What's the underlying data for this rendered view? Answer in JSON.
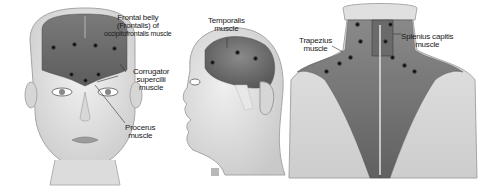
{
  "figure": {
    "panels": [
      {
        "id": "frontal-face",
        "labels": [
          {
            "text_lines": [
              "Frontal belly",
              "(Frontalis) of",
              "occipitofrontalis muscle"
            ]
          },
          {
            "text_lines": [
              "Corrugator",
              "supercilii",
              "muscle"
            ]
          },
          {
            "text_lines": [
              "Procerus",
              "muscle"
            ]
          }
        ],
        "injection_points": 7
      },
      {
        "id": "lateral-head",
        "labels": [
          {
            "text_lines": [
              "Temporalis",
              "muscle"
            ]
          }
        ],
        "injection_points": 3
      },
      {
        "id": "posterior-neck",
        "labels": [
          {
            "text_lines": [
              "Trapezius",
              "muscle"
            ]
          },
          {
            "text_lines": [
              "Splenius capitis",
              "muscle"
            ]
          }
        ],
        "injection_points": 10
      }
    ],
    "colors": {
      "muscle": "#6e6e6e",
      "skin": "#e4e4e4",
      "outline": "#9a9a9a",
      "dot": "#111111",
      "text": "#1a1a1a"
    }
  }
}
